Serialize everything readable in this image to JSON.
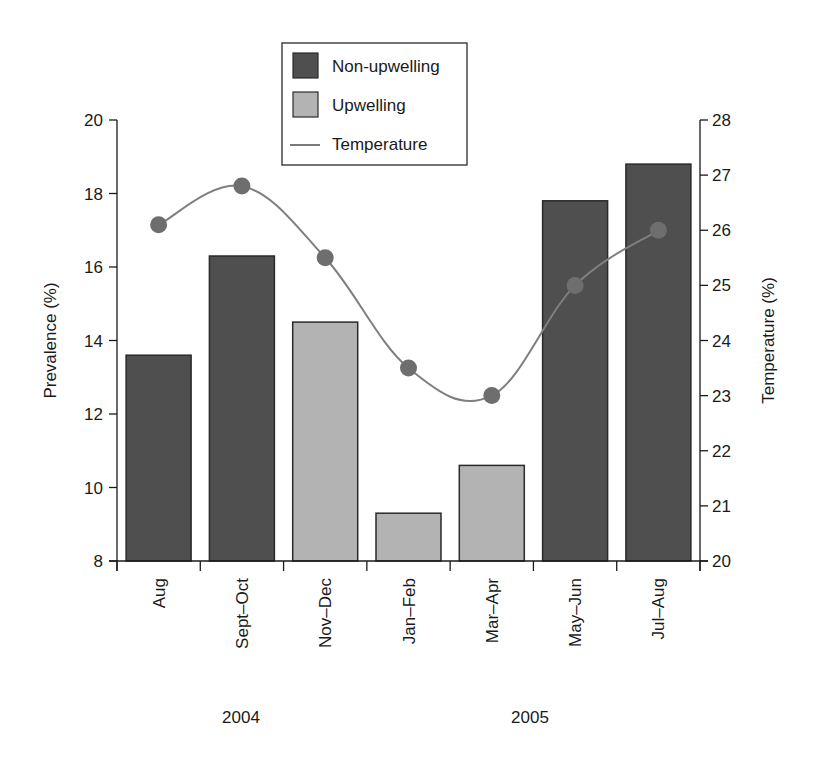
{
  "chart_data": {
    "type": "bar",
    "title": "",
    "categories": [
      "Aug",
      "Sept–Oct",
      "Nov–Dec",
      "Jan–Feb",
      "Mar–Apr",
      "May–Jun",
      "Jul–Aug"
    ],
    "year_labels": [
      {
        "label": "2004",
        "spans": [
          "Aug",
          "Sept–Oct",
          "Nov–Dec"
        ]
      },
      {
        "label": "2005",
        "spans": [
          "Jan–Feb",
          "Mar–Apr",
          "May–Jun",
          "Jul–Aug"
        ]
      }
    ],
    "series": [
      {
        "name": "Prevalence",
        "type": "bar",
        "axis": "left",
        "values": [
          13.6,
          16.3,
          14.5,
          9.3,
          10.6,
          17.8,
          18.8
        ],
        "group": [
          "Non-upwelling",
          "Non-upwelling",
          "Upwelling",
          "Upwelling",
          "Upwelling",
          "Non-upwelling",
          "Non-upwelling"
        ]
      },
      {
        "name": "Temperature",
        "type": "line",
        "axis": "right",
        "values": [
          26.1,
          26.8,
          25.5,
          23.5,
          23.0,
          25.0,
          26.0
        ]
      }
    ],
    "xlabel": "",
    "ylabel": "Prevalence (%)",
    "y2label": "Temperature (%)",
    "ylim": [
      8,
      20
    ],
    "y2lim": [
      20,
      28
    ],
    "yticks": [
      8,
      10,
      12,
      14,
      16,
      18,
      20
    ],
    "y2ticks": [
      20,
      21,
      22,
      23,
      24,
      25,
      26,
      27,
      28
    ],
    "grid": false,
    "legend": {
      "position": "top-center",
      "entries": [
        {
          "label": "Non-upwelling",
          "kind": "box",
          "color": "#4f4f4f"
        },
        {
          "label": "Upwelling",
          "kind": "box",
          "color": "#b3b3b3"
        },
        {
          "label": "Temperature",
          "kind": "line",
          "color": "#7a7a7a"
        }
      ]
    },
    "colors": {
      "non_upwelling": "#4f4f4f",
      "upwelling": "#b3b3b3",
      "temperature_line": "#7f7f7f",
      "temperature_marker": "#6e6e6e",
      "axis": "#1a1a1a"
    }
  }
}
